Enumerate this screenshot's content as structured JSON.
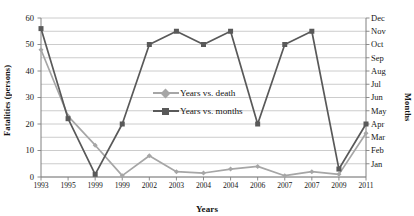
{
  "chart_data": {
    "type": "line",
    "title": "",
    "xlabel": "Years",
    "ylabel": "Fatalities (persons)",
    "ylabel_right": "Months",
    "grid": true,
    "legend_position": "center",
    "ylim": [
      0,
      60
    ],
    "ytick_step": 10,
    "gridline_step": 5,
    "yticks": [
      "60",
      "50",
      "40",
      "30",
      "20",
      "10",
      "0"
    ],
    "yticks_right": [
      "Dec",
      "Nov",
      "Oct",
      "Sep",
      "Aug",
      "Jul",
      "Jun",
      "May",
      "Apr",
      "Mar",
      "Feb",
      "Jan"
    ],
    "categories": [
      "1993",
      "1995",
      "1999",
      "1999",
      "2002",
      "2003",
      "2004",
      "2004",
      "2006",
      "2007",
      "2007",
      "2009",
      "2011"
    ],
    "series": [
      {
        "name": "Years vs. death",
        "color": "#a6a6a6",
        "marker": "diamond",
        "values": [
          48,
          23,
          12,
          0.5,
          8,
          2,
          1.5,
          3,
          4,
          0.5,
          2,
          1,
          16.5
        ]
      },
      {
        "name": "Years vs. months",
        "color": "#595959",
        "marker": "square",
        "month_values": [
          "Dec",
          "May",
          "Jan",
          "Apr",
          "Nov",
          "Dec",
          "Oct",
          "Dec",
          "May",
          "Nov",
          "Dec",
          "Feb",
          "May"
        ],
        "values": [
          56,
          22,
          1,
          20,
          50,
          55,
          50,
          55,
          20,
          50,
          55,
          3,
          20
        ]
      }
    ]
  },
  "legend": {
    "items": [
      {
        "label": "Years vs. death"
      },
      {
        "label": "Years vs. months"
      }
    ]
  },
  "colors": {
    "series_light": "#a6a6a6",
    "series_dark": "#595959",
    "grid": "#bfbfbf",
    "axis": "#808080",
    "text": "#161616"
  }
}
